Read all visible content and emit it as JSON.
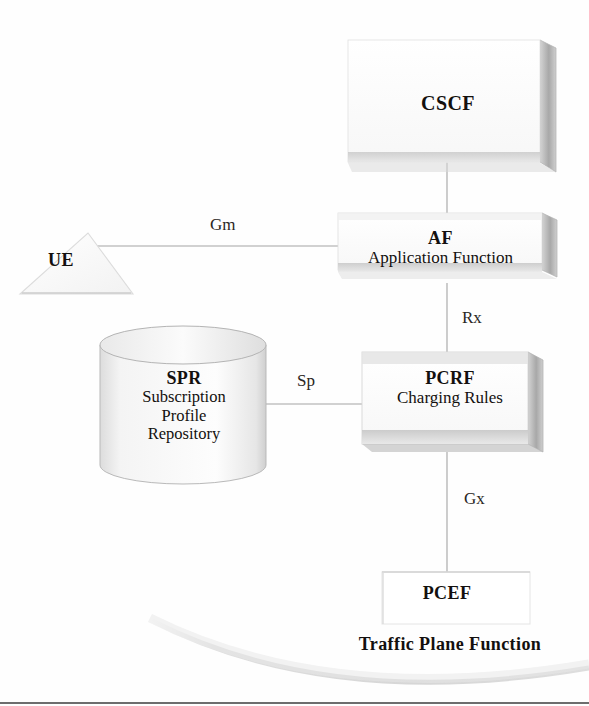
{
  "diagram": {
    "background_color": "#fefefe"
  },
  "nodes": {
    "cscf": {
      "id": "CSCF",
      "title": "CSCF",
      "subtitle": "",
      "shape": "3d-box",
      "fill": "#fcfcfc",
      "edge": "#bdbdbd"
    },
    "af": {
      "id": "AF",
      "title": "AF",
      "subtitle": "Application Function",
      "shape": "3d-box",
      "fill": "#fbfbfb",
      "edge": "#bdbdbd"
    },
    "pcrf": {
      "id": "PCRF",
      "title": "PCRF",
      "subtitle": "Charging Rules",
      "shape": "3d-box",
      "fill": "#fbfbfb",
      "edge": "#b5b5b5"
    },
    "spr": {
      "id": "SPR",
      "title": "SPR",
      "subtitle_line1": "Subscription",
      "subtitle_line2": "Profile",
      "subtitle_line3": "Repository",
      "shape": "cylinder",
      "fill": "#fafafa",
      "edge": "#b9b9b9"
    },
    "ue": {
      "id": "UE",
      "title": "UE",
      "subtitle": "",
      "shape": "triangle",
      "fill": "#fdfdfd",
      "edge": "#dcdcdc"
    },
    "pcef": {
      "id": "PCEF",
      "title": "PCEF",
      "subtitle": "",
      "shape": "box",
      "fill": "#ffffff",
      "edge": "#e2e2e2"
    }
  },
  "region": {
    "traffic_plane": {
      "label": "Traffic Plane Function",
      "shape": "arc"
    }
  },
  "interfaces": [
    {
      "name": "Gm",
      "from": "UE",
      "to": "AF",
      "orientation": "horizontal"
    },
    {
      "name": "Rx",
      "from": "AF",
      "to": "PCRF",
      "orientation": "vertical"
    },
    {
      "name": "Sp",
      "from": "SPR",
      "to": "PCRF",
      "orientation": "horizontal"
    },
    {
      "name": "Gx",
      "from": "PCRF",
      "to": "PCEF",
      "orientation": "vertical"
    }
  ],
  "links": {
    "cscf_af": {
      "from": "CSCF",
      "to": "AF",
      "name": ""
    }
  },
  "colors": {
    "line": "#c8c8c8",
    "text": "#13100e",
    "box_face": "#fbfbfb",
    "box_side": "#9d9d9d",
    "box_shadow": "#c4c4c4"
  }
}
